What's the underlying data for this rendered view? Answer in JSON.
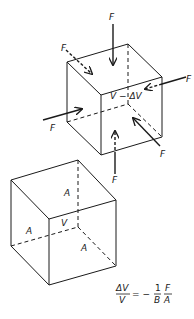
{
  "diagram": {
    "compressed_cube": {
      "volume_label": "V − ΔV",
      "force_labels": [
        "F",
        "F",
        "F",
        "F",
        "F",
        "F"
      ]
    },
    "original_cube": {
      "volume_label": "V",
      "face_labels": [
        "A",
        "A",
        "A"
      ]
    },
    "formula": {
      "lhs_numerator": "ΔV",
      "lhs_denominator": "V",
      "equals": "= −",
      "coef_numerator": "1",
      "coef_denominator": "B",
      "rhs_numerator": "F",
      "rhs_denominator": "A"
    },
    "colors": {
      "ink": "#1a1a1a",
      "background": "#ffffff"
    }
  }
}
